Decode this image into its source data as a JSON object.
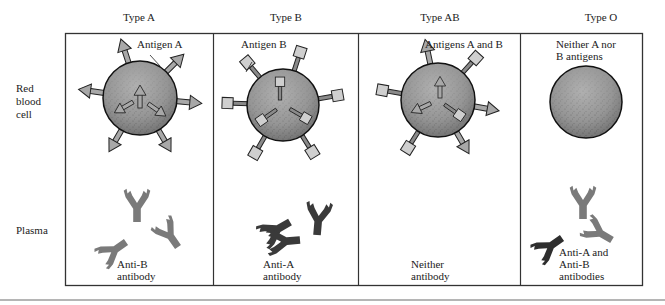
{
  "columns": [
    {
      "id": "type-a",
      "header": "Type A",
      "antigen_label": "Antigen A",
      "antibody_label_1": "Anti-B",
      "antibody_label_2": "antibody",
      "antibody_label_3": ""
    },
    {
      "id": "type-b",
      "header": "Type B",
      "antigen_label": "Antigen B",
      "antibody_label_1": "Anti-A",
      "antibody_label_2": "antibody",
      "antibody_label_3": ""
    },
    {
      "id": "type-ab",
      "header": "Type AB",
      "antigen_label": "Antigens A and B",
      "antibody_label_1": "Neither",
      "antibody_label_2": "antibody",
      "antibody_label_3": ""
    },
    {
      "id": "type-o",
      "header": "Type O",
      "antigen_label_1": "Neither A nor",
      "antigen_label_2": "B antigens",
      "antibody_label_1": "Anti-A and",
      "antibody_label_2": "Anti-B",
      "antibody_label_3": "antibodies"
    }
  ],
  "rows": {
    "rbc_label_1": "Red",
    "rbc_label_2": "blood",
    "rbc_label_3": "cell",
    "plasma_label": "Plasma"
  },
  "colors": {
    "cell_fill": "#9a9a9a",
    "antigen_a_fill": "#a8a8a8",
    "antigen_b_fill": "#c8c8c8",
    "anti_b_antibody": "#7a7a7a",
    "anti_a_antibody": "#3a3a3a",
    "border": "#333333"
  }
}
